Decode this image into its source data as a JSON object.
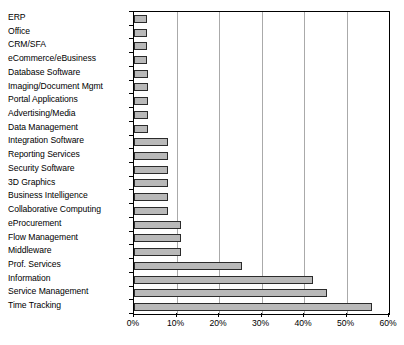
{
  "chart_data": {
    "type": "bar",
    "orientation": "horizontal",
    "title": "",
    "subtitle": "",
    "xlabel": "",
    "ylabel": "",
    "xlim": [
      0,
      60
    ],
    "x_tick_labels": [
      "0%",
      "10%",
      "20%",
      "30%",
      "40%",
      "50%",
      "60%"
    ],
    "x_tick_values": [
      0,
      10,
      20,
      30,
      40,
      50,
      60
    ],
    "x_tick_interval": 10,
    "grid": "vertical",
    "legend": "none",
    "legend_position": "none",
    "series_name": "",
    "categories": [
      "ERP",
      "Office",
      "CRM/SFA",
      "eCommerce/eBusiness",
      "Database Software",
      "Imaging/Document Mgmt",
      "Portal Applications",
      "Advertising/Media",
      "Data Management",
      "Integration Software",
      "Reporting Services",
      "Security Software",
      "3D Graphics",
      "Business Intelligence",
      "Collaborative Computing",
      "eProcurement",
      "Flow Management",
      "Middleware",
      "Prof. Services",
      "Information",
      "Service Management",
      "Time Tracking"
    ],
    "values": [
      3.0,
      3.0,
      3.0,
      3.0,
      3.2,
      3.2,
      3.2,
      3.2,
      3.4,
      8.0,
      8.0,
      8.0,
      8.0,
      8.0,
      8.0,
      11.0,
      11.0,
      11.0,
      25.5,
      42.0,
      45.5,
      56.0
    ],
    "bar_fill_color": "#b9b9b9",
    "bar_border_color": "#2b2b2b",
    "gridline_color": "#aaaaaa",
    "axis_color": "#000000",
    "background_color": "#ffffff"
  }
}
